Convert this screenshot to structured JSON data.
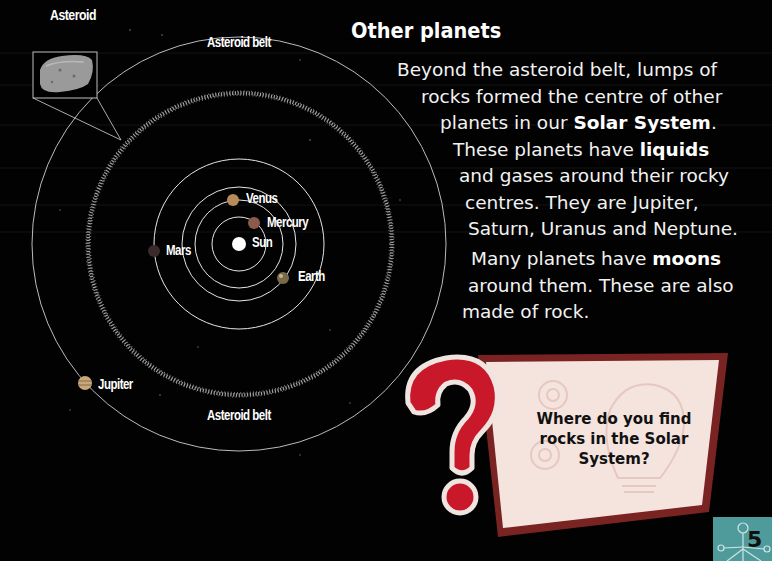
{
  "diagram": {
    "labels": {
      "asteroid": "Asteroid",
      "asteroid_belt_top": "Asteroid belt",
      "asteroid_belt_bottom": "Asteroid belt",
      "venus": "Venus",
      "mercury": "Mercury",
      "sun": "Sun",
      "mars": "Mars",
      "earth": "Earth",
      "jupiter": "Jupiter"
    }
  },
  "article": {
    "heading": "Other planets",
    "para1": {
      "line1": "Beyond the asteroid belt, lumps of",
      "line2": "rocks formed the centre of other",
      "line3_pre": "planets in our ",
      "line3_bold": "Solar System",
      "line3_post": ".",
      "line4_pre": "These planets have ",
      "line4_bold": "liquids",
      "line5": "and gases around their rocky",
      "line6": "centres. They are Jupiter,",
      "line7": "Saturn, Uranus and Neptune."
    },
    "para2": {
      "line1_pre": "Many planets have ",
      "line1_bold": "moons",
      "line2": "around them. These are also",
      "line3": "made of rock."
    }
  },
  "question_box": {
    "line1": "Where do you find",
    "line2": "rocks in the Solar",
    "line3": "System?",
    "colors": {
      "question_mark": "#c8182a",
      "box_fill": "#f5e3de",
      "box_border": "#8a2a2a"
    }
  },
  "page_number": "5",
  "colors": {
    "background": "#000000",
    "page_tab": "#4f9a9a"
  }
}
